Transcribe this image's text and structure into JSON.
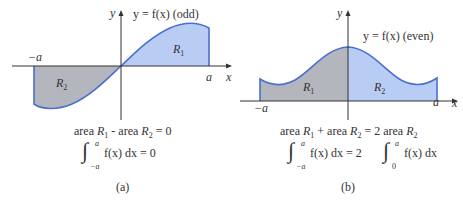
{
  "colors": {
    "blue_fill": "#b9ccf3",
    "gray_fill": "#b4b6bd",
    "curve": "#4a6fd0",
    "axis": "#333333"
  },
  "panel_a": {
    "curve_label": "y = f(x) (odd)",
    "y_axis_label": "y",
    "x_axis_label": "x",
    "left_bound": "−a",
    "right_bound": "a",
    "region_right": "R",
    "region_right_sub": "1",
    "region_left": "R",
    "region_left_sub": "2",
    "area_equation": {
      "part1": "area ",
      "r1": "R",
      "r1_sub": "1",
      "part2": " - area ",
      "r2": "R",
      "r2_sub": "2",
      "part3": " = 0"
    },
    "integral": {
      "upper": "a",
      "lower": "−a",
      "integrand": "f(x) dx = 0"
    },
    "caption": "(a)"
  },
  "panel_b": {
    "curve_label": "y = f(x) (even)",
    "y_axis_label": "y",
    "x_axis_label": "x",
    "left_bound": "−a",
    "right_bound": "a",
    "region_left": "R",
    "region_left_sub": "1",
    "region_right": "R",
    "region_right_sub": "2",
    "area_equation": {
      "part1": "area ",
      "r1": "R",
      "r1_sub": "1",
      "part2": " + area ",
      "r2": "R",
      "r2_sub": "2",
      "part3": " = 2 area ",
      "r3": "R",
      "r3_sub": "2"
    },
    "integral": {
      "upper1": "a",
      "lower1": "−a",
      "middle": "f(x) dx = 2",
      "upper2": "a",
      "lower2": "0",
      "integrand2": "f(x) dx"
    },
    "caption": "(b)"
  }
}
